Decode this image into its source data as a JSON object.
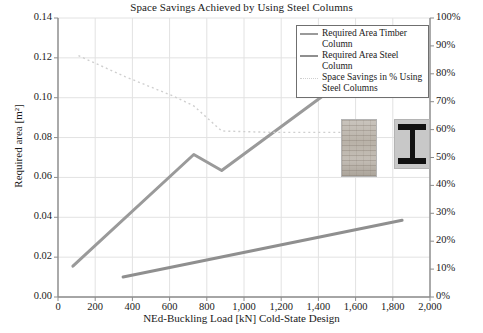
{
  "chart_data": {
    "type": "line",
    "title": "Space Savings Achieved by Using Steel Columns",
    "xlabel": "NEd-Buckling Load [kN] Cold-State Design",
    "ylabel": "Required area [m²]",
    "ylabel_right": "",
    "xlim": [
      0,
      2000
    ],
    "ylim": [
      0.0,
      0.14
    ],
    "ylim_right": [
      0,
      100
    ],
    "grid": true,
    "legend_position": "top-right",
    "xticks": [
      "0",
      "200",
      "400",
      "600",
      "800",
      "1,000",
      "1,200",
      "1,400",
      "1,600",
      "1,800",
      "2,000"
    ],
    "xtick_values": [
      0,
      200,
      400,
      600,
      800,
      1000,
      1200,
      1400,
      1600,
      1800,
      2000
    ],
    "yticks_left": [
      "0.00",
      "0.02",
      "0.04",
      "0.06",
      "0.08",
      "0.10",
      "0.12",
      "0.14"
    ],
    "ytick_values_left": [
      0.0,
      0.02,
      0.04,
      0.06,
      0.08,
      0.1,
      0.12,
      0.14
    ],
    "yticks_right": [
      "0%",
      "10%",
      "20%",
      "30%",
      "40%",
      "50%",
      "60%",
      "70%",
      "80%",
      "90%",
      "100%"
    ],
    "ytick_values_right": [
      0,
      10,
      20,
      30,
      40,
      50,
      60,
      70,
      80,
      90,
      100
    ],
    "series": [
      {
        "name": "Required Area Timber Column",
        "axis": "left",
        "style": "solid",
        "color": "#9a9a9a",
        "points": [
          [
            80,
            0.0155
          ],
          [
            730,
            0.0715
          ],
          [
            880,
            0.0635
          ],
          [
            1520,
            0.1075
          ]
        ]
      },
      {
        "name": "Required Area Steel Column",
        "axis": "left",
        "style": "solid",
        "color": "#8f8f8f",
        "points": [
          [
            350,
            0.01
          ],
          [
            1850,
            0.0385
          ]
        ]
      },
      {
        "name": "Space Savings in % Using Steel Columns",
        "axis": "right",
        "style": "dotted",
        "color": "#cfcfcf",
        "points": [
          [
            110,
            86.5
          ],
          [
            360,
            79.0
          ],
          [
            620,
            72.0
          ],
          [
            730,
            68.5
          ],
          [
            880,
            59.5
          ],
          [
            1150,
            59.0
          ],
          [
            1520,
            59.0
          ]
        ]
      }
    ],
    "legend": [
      {
        "label": "Required Area Timber Column",
        "marker": "line",
        "color": "#9a9a9a"
      },
      {
        "label": "Required Area Steel Column",
        "marker": "line",
        "color": "#8f8f8f"
      },
      {
        "label": "Space Savings in % Using Steel Columns",
        "marker": "dotted",
        "color": "#cfcfcf"
      }
    ],
    "annotations": [
      {
        "name": "timber-column-photo",
        "description": "Timber column cross-section photo"
      },
      {
        "name": "steel-i-beam-photo",
        "description": "Steel I-beam cross-section photo"
      }
    ]
  }
}
